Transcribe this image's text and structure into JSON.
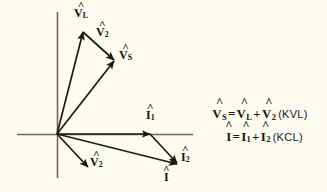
{
  "figure": {
    "type": "phasor-diagram",
    "background_color": "#fdfbef",
    "ink_color": "#1a1a18",
    "axis_color": "#5a5a55",
    "origin": {
      "x": 57,
      "y": 134
    },
    "axes": {
      "horizontal": {
        "x1": 17,
        "y1": 134,
        "x2": 193,
        "y2": 134
      },
      "vertical": {
        "x1": 57,
        "y1": 12,
        "x2": 57,
        "y2": 178
      }
    },
    "vectors": [
      {
        "name": "V_L",
        "label_base": "V",
        "label_sub": "L",
        "tip": {
          "x": 83,
          "y": 31
        },
        "label_pos": {
          "x": 74,
          "y": 8
        }
      },
      {
        "name": "V_2_upper",
        "label_base": "V",
        "label_sub": "2",
        "tip": {
          "x": 116,
          "y": 62
        },
        "label_pos": {
          "x": 96,
          "y": 27
        },
        "note": "drawn from tip of V_L to tip of V_S"
      },
      {
        "name": "V_S",
        "label_base": "V",
        "label_sub": "S",
        "tip": {
          "x": 116,
          "y": 62
        },
        "label_pos": {
          "x": 120,
          "y": 50
        }
      },
      {
        "name": "V_2_lower",
        "label_base": "V",
        "label_sub": "2",
        "tip": {
          "x": 88,
          "y": 167
        },
        "label_pos": {
          "x": 91,
          "y": 157
        }
      },
      {
        "name": "I_1",
        "label_base": "I",
        "label_sub": "1",
        "tip": {
          "x": 150,
          "y": 134
        },
        "label_pos": {
          "x": 147,
          "y": 110
        }
      },
      {
        "name": "I_2",
        "label_base": "I",
        "label_sub": "2",
        "tip": {
          "x": 178,
          "y": 165
        },
        "label_pos": {
          "x": 182,
          "y": 152
        },
        "note": "drawn from tip of I_1 to tip of I"
      },
      {
        "name": "I",
        "label_base": "I",
        "label_sub": "",
        "tip": {
          "x": 178,
          "y": 165
        },
        "label_pos": {
          "x": 166,
          "y": 172
        }
      }
    ]
  },
  "equations": {
    "kvl": {
      "lhs_base": "V",
      "lhs_sub": "S",
      "equals": "=",
      "term1_base": "V",
      "term1_sub": "L",
      "plus": "+",
      "term2_base": "V",
      "term2_sub": "2",
      "law": "(KVL)"
    },
    "kcl": {
      "lhs_base": "I",
      "lhs_sub": "",
      "equals": "=",
      "term1_base": "I",
      "term1_sub": "1",
      "plus": "+",
      "term2_base": "I",
      "term2_sub": "2",
      "law": "(KCL)"
    },
    "hat": "^"
  },
  "labels": {
    "v_l": {
      "base": "V",
      "sub": "L"
    },
    "v_2_top": {
      "base": "V",
      "sub": "2"
    },
    "v_s": {
      "base": "V",
      "sub": "S"
    },
    "v_2_bottom": {
      "base": "V",
      "sub": "2"
    },
    "i_1": {
      "base": "I",
      "sub": "1"
    },
    "i_2": {
      "base": "I",
      "sub": "2"
    },
    "i": {
      "base": "I",
      "sub": ""
    }
  }
}
